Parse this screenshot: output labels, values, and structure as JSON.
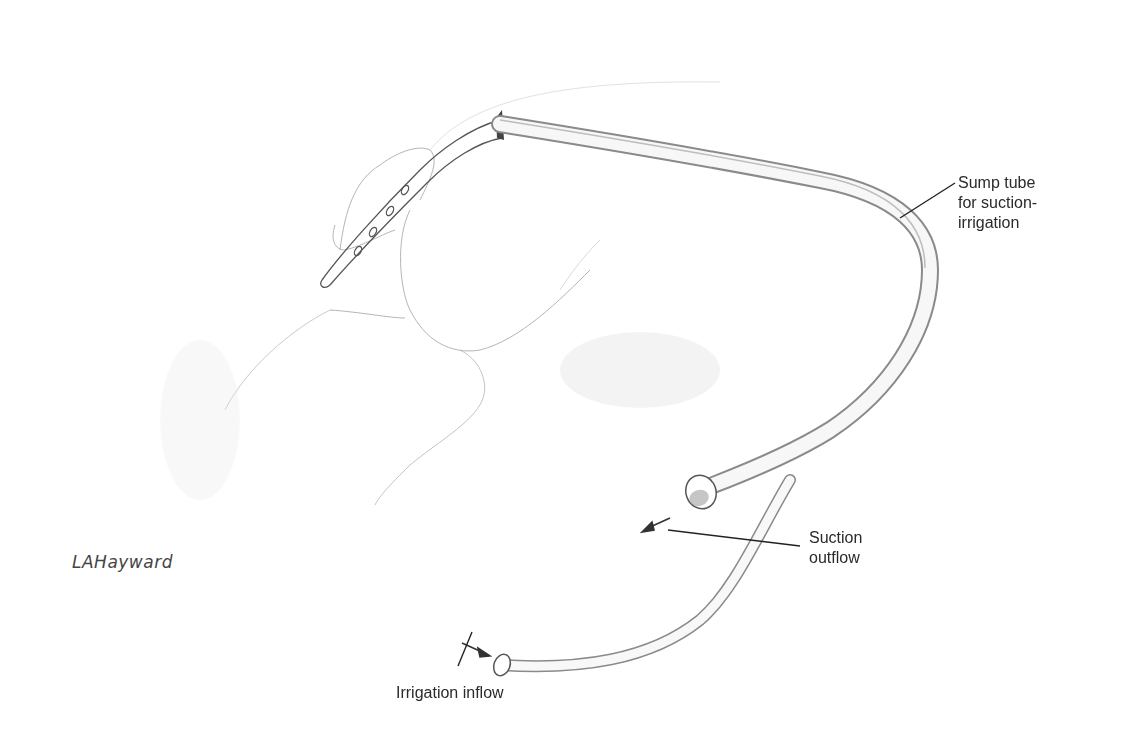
{
  "figure": {
    "labels": {
      "sump_tube": "Sump tube\nfor suction-\nirrigation",
      "suction_outflow": "Suction\noutflow",
      "irrigation_inflow": "Irrigation inflow"
    },
    "signature": "LAHayward",
    "colors": {
      "background": "#ffffff",
      "line": "#2a2a2a",
      "sketch": "#9a9a9a",
      "tube_shade": "#8a8a8a"
    }
  }
}
